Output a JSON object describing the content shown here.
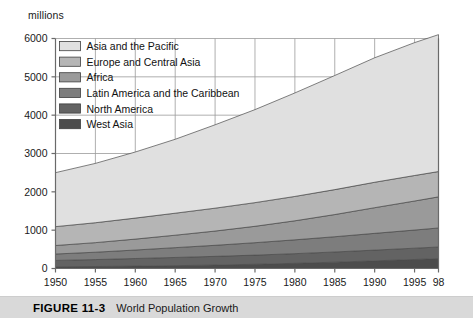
{
  "figure": {
    "number_label": "FIGURE 11-3",
    "title": "World Population Growth",
    "caption_bar_color": "#d9d9d9"
  },
  "chart_data": {
    "type": "area",
    "stacked": true,
    "title": "World Population Growth",
    "xlabel": "",
    "ylabel": "millions",
    "unit_label": "millions",
    "grid": true,
    "legend_position": "inside-top-left",
    "xlim": [
      1950,
      1998
    ],
    "ylim": [
      0,
      6000
    ],
    "yticks": [
      0,
      1000,
      2000,
      3000,
      4000,
      5000,
      6000
    ],
    "ytick_labels": [
      "0",
      "1000",
      "2000",
      "3000",
      "4000",
      "5000",
      "6000"
    ],
    "xticks": [
      1950,
      1955,
      1960,
      1965,
      1970,
      1975,
      1980,
      1985,
      1990,
      1995,
      1998
    ],
    "xtick_labels": [
      "1950",
      "1955",
      "1960",
      "1965",
      "1970",
      "1975",
      "1980",
      "1985",
      "1990",
      "1995",
      "98"
    ],
    "x": [
      1950,
      1955,
      1960,
      1965,
      1970,
      1975,
      1980,
      1985,
      1990,
      1995,
      1998
    ],
    "series": [
      {
        "name": "West Asia",
        "color": "#4c4c4c",
        "values": [
          45,
          52,
          62,
          74,
          90,
          110,
          135,
          165,
          200,
          235,
          258
        ]
      },
      {
        "name": "North America",
        "color": "#636363",
        "values": [
          166,
          181,
          199,
          214,
          227,
          239,
          252,
          266,
          280,
          295,
          303
        ]
      },
      {
        "name": "Latin America and the Caribbean",
        "color": "#7d7d7d",
        "values": [
          167,
          192,
          221,
          256,
          288,
          324,
          361,
          398,
          437,
          473,
          496
        ]
      },
      {
        "name": "Africa",
        "color": "#9a9a9a",
        "values": [
          222,
          250,
          285,
          325,
          372,
          428,
          496,
          578,
          669,
          757,
          812
        ]
      },
      {
        "name": "Europe and Central Asia",
        "color": "#b5b5b5",
        "values": [
          492,
          519,
          548,
          574,
          597,
          617,
          636,
          651,
          664,
          666,
          660
        ]
      },
      {
        "name": "Asia and the Pacific",
        "color": "#e0e0e0",
        "values": [
          1408,
          1548,
          1724,
          1928,
          2175,
          2427,
          2700,
          2977,
          3247,
          3466,
          3572
        ]
      }
    ],
    "stack_totals": [
      2500,
      2742,
      3039,
      3371,
      3749,
      4145,
      4580,
      5035,
      5497,
      5892,
      6101
    ],
    "legend_entries": [
      {
        "label": "Asia and the Pacific",
        "color": "#e0e0e0"
      },
      {
        "label": "Europe and Central Asia",
        "color": "#b5b5b5"
      },
      {
        "label": "Africa",
        "color": "#9a9a9a"
      },
      {
        "label": "Latin America and the Caribbean",
        "color": "#7d7d7d"
      },
      {
        "label": "North America",
        "color": "#636363"
      },
      {
        "label": "West Asia",
        "color": "#4c4c4c"
      }
    ]
  }
}
